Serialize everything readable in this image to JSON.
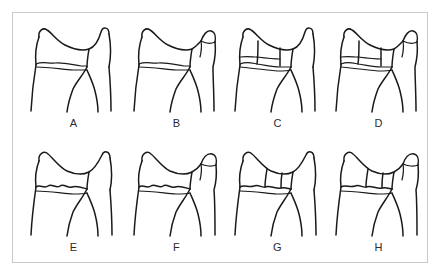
{
  "figure": {
    "frame_color": "#c9c9c9",
    "background_color": "#ffffff",
    "ink_color": "#1a1a1a",
    "rows": 2,
    "columns": 4
  },
  "specimens": [
    {
      "label": "A",
      "row": 1,
      "column": 1,
      "extra_cusp": false,
      "crown_divisions": 1,
      "cervical_line": "smooth-wavy"
    },
    {
      "label": "B",
      "row": 1,
      "column": 2,
      "extra_cusp": true,
      "crown_divisions": 1,
      "cervical_line": "smooth-wavy"
    },
    {
      "label": "C",
      "row": 1,
      "column": 3,
      "extra_cusp": false,
      "crown_divisions": 3,
      "cervical_line": "stepped"
    },
    {
      "label": "D",
      "row": 1,
      "column": 4,
      "extra_cusp": true,
      "crown_divisions": 3,
      "cervical_line": "stepped"
    },
    {
      "label": "E",
      "row": 2,
      "column": 1,
      "extra_cusp": false,
      "crown_divisions": 1,
      "cervical_line": "scalloped"
    },
    {
      "label": "F",
      "row": 2,
      "column": 2,
      "extra_cusp": true,
      "crown_divisions": 1,
      "cervical_line": "scalloped"
    },
    {
      "label": "G",
      "row": 2,
      "column": 3,
      "extra_cusp": false,
      "crown_divisions": 2,
      "cervical_line": "scalloped"
    },
    {
      "label": "H",
      "row": 2,
      "column": 4,
      "extra_cusp": true,
      "crown_divisions": 2,
      "cervical_line": "scalloped"
    }
  ]
}
